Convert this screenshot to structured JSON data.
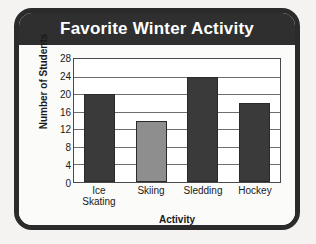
{
  "card": {
    "frame_color": "#2b2b2b",
    "header_color": "#2f2f2f",
    "background_color": "#fbfbf9"
  },
  "chart_data": {
    "type": "bar",
    "title": "Favorite Winter Activity",
    "xlabel": "Activity",
    "ylabel": "Number of Students",
    "categories": [
      "Ice Skating",
      "Skiing",
      "Sledding",
      "Hockey"
    ],
    "category_lines": [
      [
        "Ice",
        "Skating"
      ],
      [
        "Skiing"
      ],
      [
        "Sledding"
      ],
      [
        "Hockey"
      ]
    ],
    "values": [
      20,
      14,
      24,
      18
    ],
    "bar_colors": [
      "#3a3a3a",
      "#8e8e8e",
      "#3a3a3a",
      "#3a3a3a"
    ],
    "ylim": [
      0,
      28
    ],
    "yticks": [
      0,
      4,
      8,
      12,
      16,
      20,
      24,
      28
    ],
    "ytick_labels": [
      "0",
      "4",
      "8",
      "12",
      "16",
      "20",
      "24",
      "28"
    ],
    "grid": true,
    "legend": false
  }
}
